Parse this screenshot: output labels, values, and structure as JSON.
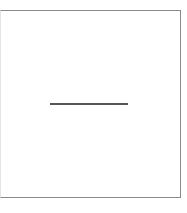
{
  "panel": {
    "border_color": "#8a8a8a",
    "background": "#ffffff"
  },
  "line": {
    "color": "#555555",
    "orientation": "horizontal"
  },
  "caption": {
    "text": ""
  }
}
